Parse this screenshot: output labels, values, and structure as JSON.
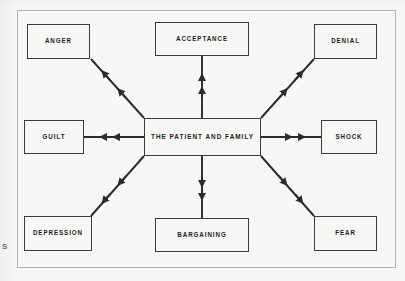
{
  "figure": {
    "type": "radial-relationship-diagram",
    "center": {
      "id": "center",
      "label": "THE PATIENT AND FAMILY"
    },
    "nodes": [
      {
        "id": "anger",
        "label": "ANGER",
        "position": "top-left"
      },
      {
        "id": "acceptance",
        "label": "ACCEPTANCE",
        "position": "top-center"
      },
      {
        "id": "denial",
        "label": "DENIAL",
        "position": "top-right"
      },
      {
        "id": "guilt",
        "label": "GUILT",
        "position": "middle-left"
      },
      {
        "id": "shock",
        "label": "SHOCK",
        "position": "middle-right"
      },
      {
        "id": "depression",
        "label": "DEPRESSION",
        "position": "bottom-left"
      },
      {
        "id": "bargaining",
        "label": "BARGAINING",
        "position": "bottom-center"
      },
      {
        "id": "fear",
        "label": "FEAR",
        "position": "bottom-right"
      }
    ],
    "connectors": [
      {
        "from": "center",
        "to": "anger",
        "direction": "outward",
        "arrowheads": 2
      },
      {
        "from": "center",
        "to": "acceptance",
        "direction": "outward",
        "arrowheads": 2
      },
      {
        "from": "center",
        "to": "denial",
        "direction": "outward",
        "arrowheads": 2
      },
      {
        "from": "center",
        "to": "guilt",
        "direction": "outward",
        "arrowheads": 2
      },
      {
        "from": "center",
        "to": "shock",
        "direction": "outward",
        "arrowheads": 2
      },
      {
        "from": "center",
        "to": "depression",
        "direction": "outward",
        "arrowheads": 2
      },
      {
        "from": "center",
        "to": "bargaining",
        "direction": "outward",
        "arrowheads": 2
      },
      {
        "from": "center",
        "to": "fear",
        "direction": "outward",
        "arrowheads": 2
      }
    ],
    "margin_mark": "S",
    "colors": {
      "page_background": "#f7f7f5",
      "frame_border": "#b4b4b2",
      "box_border": "#3a3a3a",
      "line": "#2b2b2b",
      "text": "#1d1d1d"
    }
  }
}
